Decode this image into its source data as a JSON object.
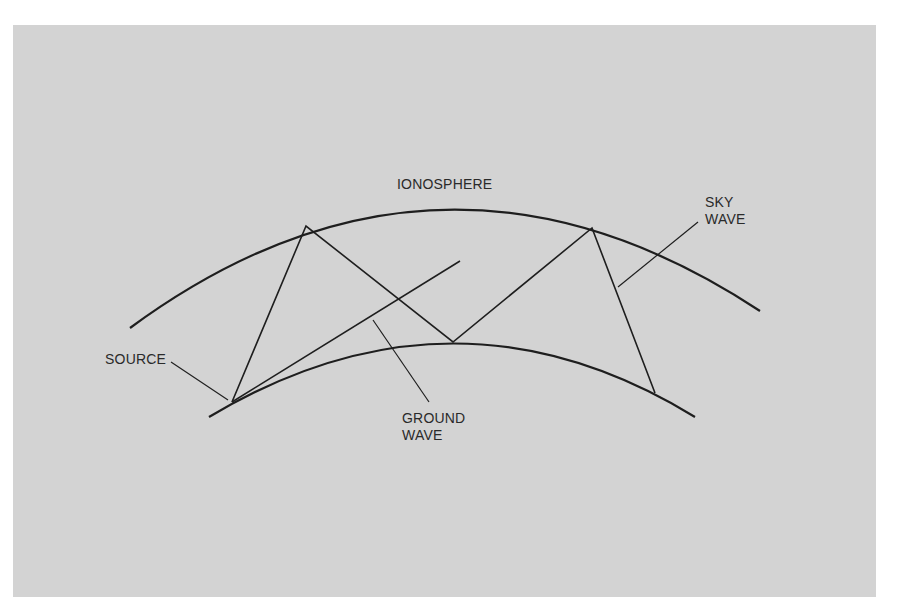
{
  "diagram": {
    "colors": {
      "background": "#d3d3d3",
      "line": "#1e1e1e",
      "page": "#ffffff"
    },
    "labels": {
      "ionosphere": "IONOSPHERE",
      "sky_wave_line1": "SKY",
      "sky_wave_line2": "WAVE",
      "source": "SOURCE",
      "ground_wave_line1": "GROUND",
      "ground_wave_line2": "WAVE"
    },
    "nodes": [
      {
        "id": "source",
        "label": "SOURCE",
        "x": 232,
        "y": 402
      },
      {
        "id": "reflect1",
        "x": 306,
        "y": 226
      },
      {
        "id": "ground_bounce",
        "x": 453,
        "y": 342
      },
      {
        "id": "reflect2",
        "x": 592,
        "y": 228
      },
      {
        "id": "receiver",
        "x": 655,
        "y": 393
      }
    ],
    "edges": [
      {
        "from": "source",
        "to": "reflect1",
        "type": "sky-wave"
      },
      {
        "from": "reflect1",
        "to": "ground_bounce",
        "type": "sky-wave"
      },
      {
        "from": "ground_bounce",
        "to": "reflect2",
        "type": "sky-wave"
      },
      {
        "from": "reflect2",
        "to": "receiver",
        "type": "sky-wave"
      },
      {
        "from": "source",
        "to": "ground-wave-end",
        "type": "ground-wave"
      }
    ]
  }
}
